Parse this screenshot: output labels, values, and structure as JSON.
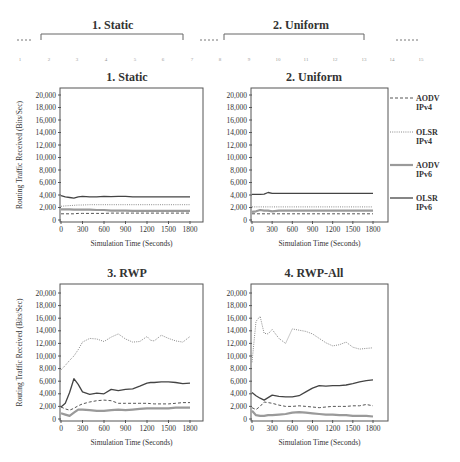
{
  "header": {
    "titles": [
      "1. Static",
      "2. Uniform"
    ],
    "ruler_numbers": [
      "1",
      "2",
      "3",
      "4",
      "5",
      "6",
      "7",
      "8",
      "9",
      "10",
      "11",
      "12",
      "13",
      "14",
      "15"
    ]
  },
  "legend": {
    "items": [
      {
        "line1": "AODV",
        "line2": "IPv4",
        "style": "dashed"
      },
      {
        "line1": "OLSR",
        "line2": "IPv4",
        "style": "dotted"
      },
      {
        "line1": "AODV",
        "line2": "IPv6",
        "style": "thick-gray"
      },
      {
        "line1": "OLSR",
        "line2": "IPv6",
        "style": "solid"
      }
    ]
  },
  "colors": {
    "aodv_ipv4": "#555555",
    "olsr_ipv4": "#8a8a8a",
    "aodv_ipv6": "#9a9a9a",
    "olsr_ipv6": "#444444",
    "frame": "#555555"
  },
  "chart_data": [
    {
      "type": "line",
      "title": "1. Static",
      "xlabel": "Simulation Time (Seconds)",
      "ylabel": "Routing Traffic Received (Bits/Sec)",
      "xticks": [
        0,
        300,
        600,
        900,
        1200,
        1500,
        1800
      ],
      "yticks": [
        0,
        2000,
        4000,
        6000,
        8000,
        10000,
        12000,
        14000,
        16000,
        18000,
        20000
      ],
      "xlim": [
        0,
        1800
      ],
      "ylim": [
        0,
        20000
      ],
      "x": [
        0,
        60,
        120,
        180,
        240,
        300,
        400,
        500,
        600,
        700,
        800,
        900,
        1000,
        1100,
        1200,
        1300,
        1400,
        1500,
        1600,
        1700,
        1800
      ],
      "series": [
        {
          "name": "AODV IPv4",
          "values": [
            1000,
            1000,
            1000,
            1000,
            1050,
            1050,
            1050,
            1050,
            1050,
            1100,
            1100,
            1100,
            1100,
            1100,
            1100,
            1100,
            1100,
            1100,
            1100,
            1100,
            1100
          ]
        },
        {
          "name": "OLSR IPv4",
          "values": [
            2200,
            2250,
            2300,
            2350,
            2400,
            2400,
            2450,
            2450,
            2450,
            2450,
            2450,
            2450,
            2450,
            2450,
            2450,
            2450,
            2450,
            2450,
            2450,
            2450,
            2450
          ]
        },
        {
          "name": "AODV IPv6",
          "values": [
            1700,
            1700,
            1700,
            1650,
            1650,
            1650,
            1650,
            1600,
            1600,
            1500,
            1500,
            1500,
            1450,
            1450,
            1450,
            1450,
            1450,
            1450,
            1450,
            1450,
            1450
          ]
        },
        {
          "name": "OLSR IPv6",
          "values": [
            3900,
            3700,
            3600,
            3500,
            3700,
            3800,
            3700,
            3700,
            3800,
            3750,
            3800,
            3800,
            3700,
            3700,
            3700,
            3700,
            3700,
            3700,
            3700,
            3700,
            3700
          ]
        }
      ]
    },
    {
      "type": "line",
      "title": "2. Uniform",
      "xlabel": "Simulation Time (Seconds)",
      "ylabel": "",
      "xticks": [
        0,
        300,
        600,
        900,
        1200,
        1500,
        1800
      ],
      "yticks": [
        0,
        2000,
        4000,
        6000,
        8000,
        10000,
        12000,
        14000,
        16000,
        18000,
        20000
      ],
      "xlim": [
        0,
        1800
      ],
      "ylim": [
        0,
        20000
      ],
      "x": [
        0,
        60,
        120,
        180,
        240,
        300,
        400,
        500,
        600,
        700,
        800,
        900,
        1000,
        1100,
        1200,
        1300,
        1400,
        1500,
        1600,
        1700,
        1800
      ],
      "series": [
        {
          "name": "AODV IPv4",
          "values": [
            1000,
            1000,
            1000,
            1000,
            1000,
            1000,
            1000,
            1000,
            1000,
            1000,
            1000,
            1000,
            1000,
            1000,
            1000,
            1000,
            1000,
            1000,
            1000,
            1000,
            1000
          ]
        },
        {
          "name": "OLSR IPv4",
          "values": [
            2100,
            2100,
            2100,
            2100,
            2100,
            2100,
            2100,
            2100,
            2100,
            2100,
            2100,
            2100,
            2100,
            2100,
            2100,
            2100,
            2100,
            2100,
            2100,
            2100,
            2100
          ]
        },
        {
          "name": "AODV IPv6",
          "values": [
            1300,
            1400,
            1600,
            1500,
            1500,
            1400,
            1500,
            1500,
            1500,
            1500,
            1500,
            1500,
            1500,
            1500,
            1500,
            1500,
            1500,
            1500,
            1500,
            1500,
            1500
          ]
        },
        {
          "name": "OLSR IPv6",
          "values": [
            4100,
            4100,
            4100,
            4150,
            4400,
            4250,
            4250,
            4250,
            4250,
            4250,
            4250,
            4250,
            4250,
            4250,
            4250,
            4250,
            4250,
            4250,
            4250,
            4250,
            4250
          ]
        }
      ]
    },
    {
      "type": "line",
      "title": "3. RWP",
      "xlabel": "Simulation Time (Seconds)",
      "ylabel": "Routing Traffic Received (Bits/Sec)",
      "xticks": [
        0,
        300,
        600,
        900,
        1200,
        1500,
        1800
      ],
      "yticks": [
        0,
        2000,
        4000,
        6000,
        8000,
        10000,
        12000,
        14000,
        16000,
        18000,
        20000
      ],
      "xlim": [
        0,
        1800
      ],
      "ylim": [
        0,
        20000
      ],
      "x": [
        0,
        60,
        120,
        180,
        240,
        300,
        400,
        500,
        600,
        700,
        800,
        900,
        1000,
        1100,
        1200,
        1250,
        1300,
        1400,
        1500,
        1600,
        1700,
        1800
      ],
      "series": [
        {
          "name": "AODV IPv4",
          "values": [
            1900,
            1600,
            1400,
            1700,
            2100,
            2400,
            2700,
            2900,
            3000,
            2900,
            2500,
            2500,
            2500,
            2500,
            2500,
            2450,
            2400,
            2400,
            2400,
            2500,
            2600,
            2600
          ]
        },
        {
          "name": "OLSR IPv4",
          "values": [
            7800,
            8500,
            9300,
            10000,
            11000,
            12200,
            12800,
            12700,
            12300,
            13000,
            13500,
            12700,
            12200,
            12300,
            13100,
            12500,
            12400,
            13300,
            12800,
            12400,
            12200,
            13100
          ]
        },
        {
          "name": "AODV IPv6",
          "values": [
            900,
            700,
            500,
            1000,
            1500,
            1500,
            1400,
            1300,
            1300,
            1400,
            1500,
            1400,
            1500,
            1600,
            1700,
            1700,
            1700,
            1700,
            1700,
            1800,
            1800,
            1800
          ]
        },
        {
          "name": "OLSR IPv6",
          "values": [
            1900,
            2500,
            4200,
            6400,
            5500,
            4300,
            3900,
            4100,
            4000,
            4700,
            4500,
            4700,
            4800,
            5200,
            5700,
            5800,
            5800,
            5900,
            5900,
            5800,
            5600,
            5700
          ]
        }
      ]
    },
    {
      "type": "line",
      "title": "4. RWP-All",
      "xlabel": "Simulation Time (Seconds)",
      "ylabel": "",
      "xticks": [
        0,
        300,
        600,
        900,
        1200,
        1500,
        1800
      ],
      "yticks": [
        0,
        2000,
        4000,
        6000,
        8000,
        10000,
        12000,
        14000,
        16000,
        18000,
        20000
      ],
      "xlim": [
        0,
        1800
      ],
      "ylim": [
        0,
        20000
      ],
      "x": [
        0,
        60,
        120,
        180,
        240,
        300,
        400,
        500,
        600,
        700,
        800,
        900,
        1000,
        1100,
        1200,
        1300,
        1400,
        1500,
        1600,
        1700,
        1800
      ],
      "series": [
        {
          "name": "AODV IPv4",
          "values": [
            1800,
            1500,
            2000,
            2700,
            2600,
            2500,
            2200,
            2000,
            2000,
            2100,
            2000,
            1900,
            1800,
            1900,
            2000,
            2000,
            2000,
            2100,
            2100,
            2300,
            2100
          ]
        },
        {
          "name": "OLSR IPv4",
          "values": [
            9000,
            15500,
            16300,
            13600,
            13500,
            14200,
            12800,
            12000,
            14300,
            14100,
            13900,
            13500,
            12800,
            12100,
            11600,
            11800,
            12200,
            11400,
            11100,
            11200,
            11300
          ]
        },
        {
          "name": "AODV IPv6",
          "values": [
            1300,
            600,
            500,
            500,
            600,
            600,
            700,
            800,
            1000,
            1100,
            1000,
            900,
            800,
            700,
            700,
            600,
            600,
            500,
            500,
            500,
            400
          ]
        },
        {
          "name": "OLSR IPv6",
          "values": [
            4200,
            3700,
            3300,
            3000,
            3400,
            3800,
            3600,
            3500,
            3500,
            3700,
            4300,
            4900,
            5300,
            5200,
            5300,
            5300,
            5400,
            5600,
            5900,
            6100,
            6200
          ]
        }
      ]
    }
  ]
}
